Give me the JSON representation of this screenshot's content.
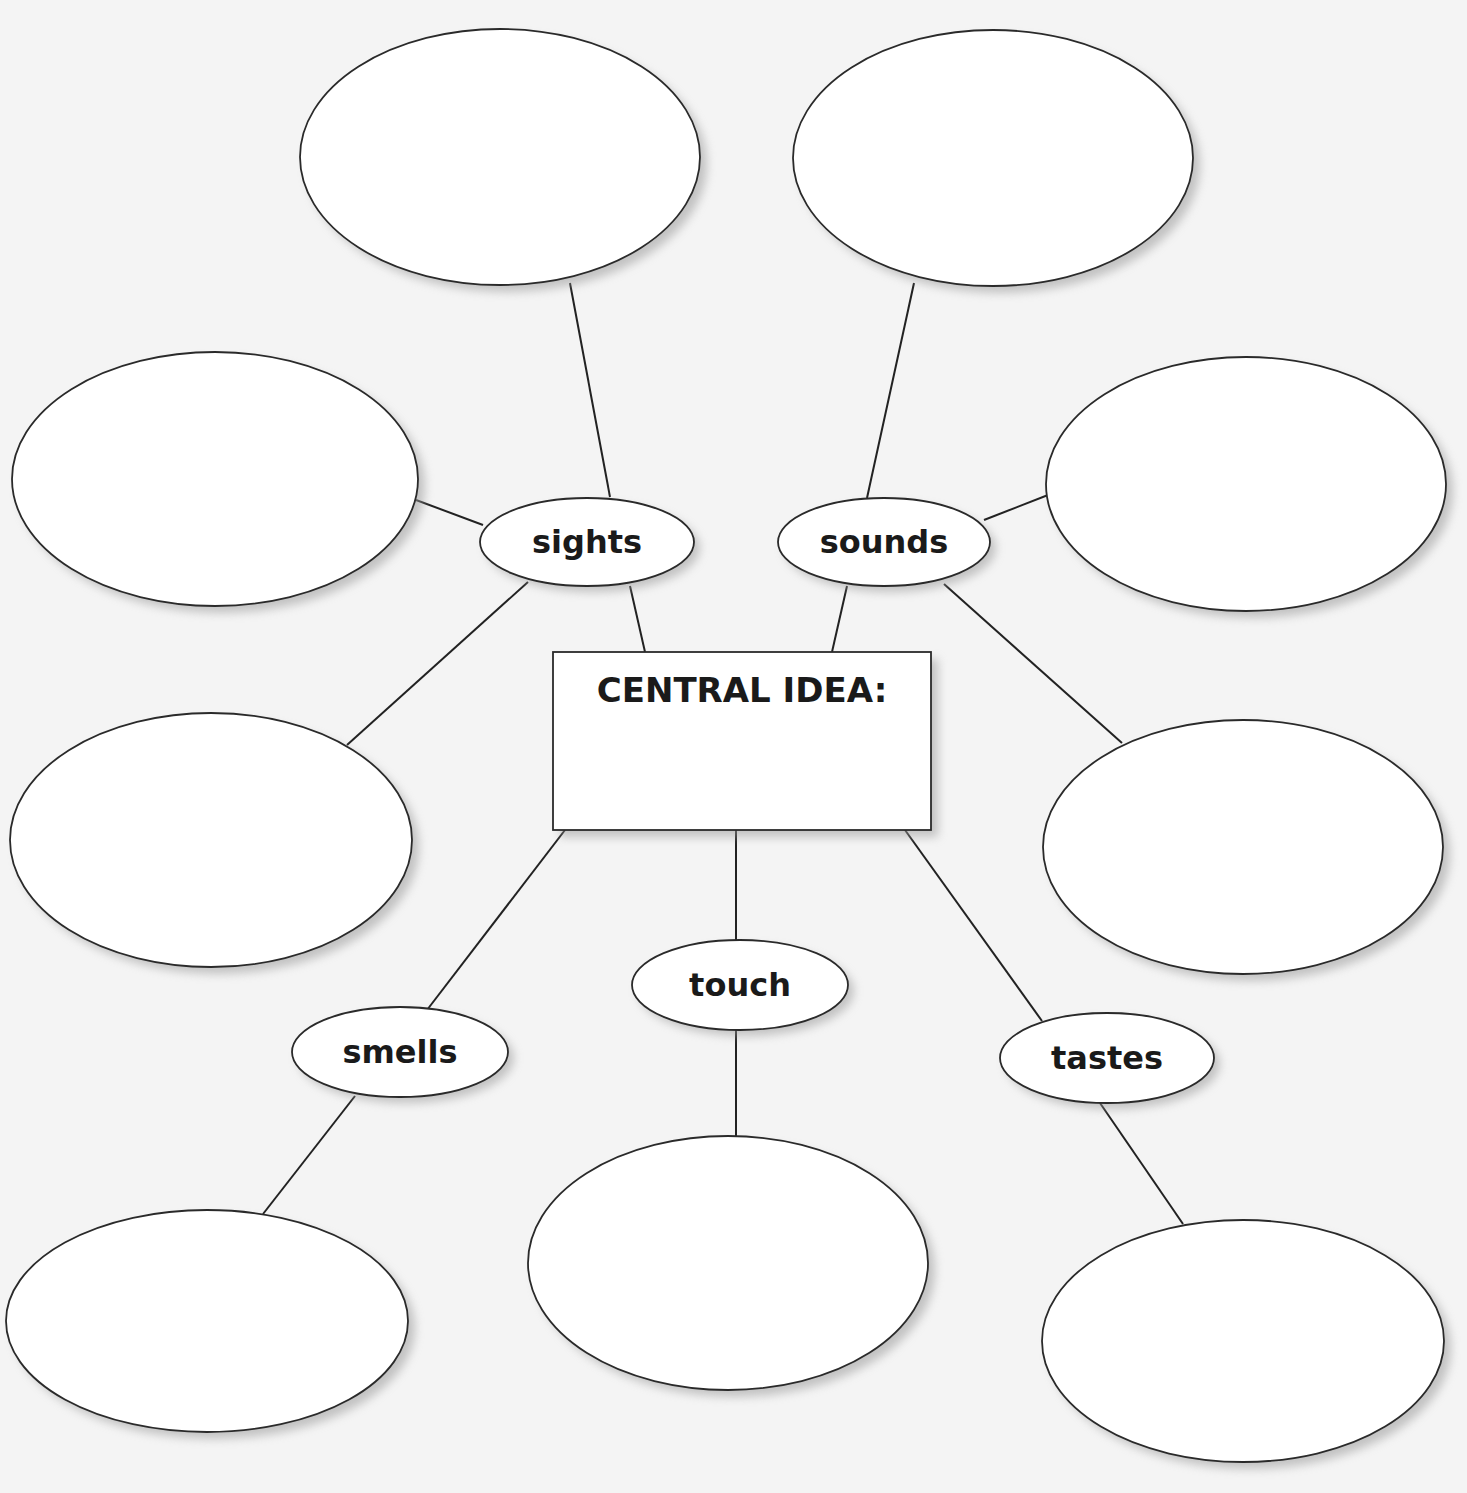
{
  "diagram": {
    "type": "sensory-details-web",
    "central": {
      "title": "CENTRAL IDEA:",
      "box": {
        "x": 553,
        "y": 652,
        "w": 378,
        "h": 178
      },
      "answer": ""
    },
    "categories": [
      {
        "id": "sights",
        "label": "sights",
        "cx": 587,
        "cy": 542,
        "rx": 107,
        "ry": 44
      },
      {
        "id": "sounds",
        "label": "sounds",
        "cx": 884,
        "cy": 542,
        "rx": 106,
        "ry": 44
      },
      {
        "id": "touch",
        "label": "touch",
        "cx": 740,
        "cy": 985,
        "rx": 108,
        "ry": 45
      },
      {
        "id": "smells",
        "label": "smells",
        "cx": 400,
        "cy": 1052,
        "rx": 108,
        "ry": 45
      },
      {
        "id": "tastes",
        "label": "tastes",
        "cx": 1107,
        "cy": 1058,
        "rx": 107,
        "ry": 45
      }
    ],
    "detail_bubbles": [
      {
        "id": "sights-detail-1",
        "parent": "sights",
        "cx": 500,
        "cy": 157,
        "rx": 200,
        "ry": 128,
        "text": ""
      },
      {
        "id": "sights-detail-2",
        "parent": "sights",
        "cx": 215,
        "cy": 479,
        "rx": 203,
        "ry": 127,
        "text": ""
      },
      {
        "id": "sights-detail-3",
        "parent": "sights",
        "cx": 211,
        "cy": 840,
        "rx": 201,
        "ry": 127,
        "text": ""
      },
      {
        "id": "sounds-detail-1",
        "parent": "sounds",
        "cx": 993,
        "cy": 158,
        "rx": 200,
        "ry": 128,
        "text": ""
      },
      {
        "id": "sounds-detail-2",
        "parent": "sounds",
        "cx": 1246,
        "cy": 484,
        "rx": 200,
        "ry": 127,
        "text": ""
      },
      {
        "id": "sounds-detail-3",
        "parent": "sounds",
        "cx": 1243,
        "cy": 847,
        "rx": 200,
        "ry": 127,
        "text": ""
      },
      {
        "id": "smells-detail-1",
        "parent": "smells",
        "cx": 207,
        "cy": 1321,
        "rx": 201,
        "ry": 111,
        "text": ""
      },
      {
        "id": "touch-detail-1",
        "parent": "touch",
        "cx": 728,
        "cy": 1263,
        "rx": 200,
        "ry": 127,
        "text": ""
      },
      {
        "id": "tastes-detail-1",
        "parent": "tastes",
        "cx": 1243,
        "cy": 1341,
        "rx": 201,
        "ry": 121,
        "text": ""
      }
    ],
    "connectors": [
      {
        "from": "sights-detail-1",
        "to": "sights",
        "x1": 570,
        "y1": 283,
        "x2": 610,
        "y2": 497
      },
      {
        "from": "sights-detail-2",
        "to": "sights",
        "x1": 416,
        "y1": 500,
        "x2": 483,
        "y2": 525
      },
      {
        "from": "sights-detail-3",
        "to": "sights",
        "x1": 347,
        "y1": 745,
        "x2": 528,
        "y2": 582
      },
      {
        "from": "sights",
        "to": "central",
        "x1": 630,
        "y1": 586,
        "x2": 645,
        "y2": 652
      },
      {
        "from": "sounds-detail-1",
        "to": "sounds",
        "x1": 914,
        "y1": 283,
        "x2": 867,
        "y2": 498
      },
      {
        "from": "sounds-detail-2",
        "to": "sounds",
        "x1": 1048,
        "y1": 495,
        "x2": 984,
        "y2": 520
      },
      {
        "from": "sounds-detail-3",
        "to": "sounds",
        "x1": 1122,
        "y1": 743,
        "x2": 944,
        "y2": 584
      },
      {
        "from": "sounds",
        "to": "central",
        "x1": 847,
        "y1": 586,
        "x2": 832,
        "y2": 652
      },
      {
        "from": "central",
        "to": "touch",
        "x1": 736,
        "y1": 830,
        "x2": 736,
        "y2": 940
      },
      {
        "from": "central",
        "to": "smells",
        "x1": 565,
        "y1": 830,
        "x2": 427,
        "y2": 1010
      },
      {
        "from": "central",
        "to": "tastes",
        "x1": 905,
        "y1": 830,
        "x2": 1042,
        "y2": 1021
      },
      {
        "from": "touch",
        "to": "touch-detail-1",
        "x1": 736,
        "y1": 1030,
        "x2": 736,
        "y2": 1137
      },
      {
        "from": "smells",
        "to": "smells-detail-1",
        "x1": 355,
        "y1": 1096,
        "x2": 263,
        "y2": 1214
      },
      {
        "from": "tastes",
        "to": "tastes-detail-1",
        "x1": 1100,
        "y1": 1103,
        "x2": 1183,
        "y2": 1224
      }
    ],
    "colors": {
      "background": "#f4f4f4",
      "stroke": "#222222",
      "fill": "#ffffff",
      "text": "#1a1a1a",
      "shadow": "#9a9a9a"
    }
  }
}
